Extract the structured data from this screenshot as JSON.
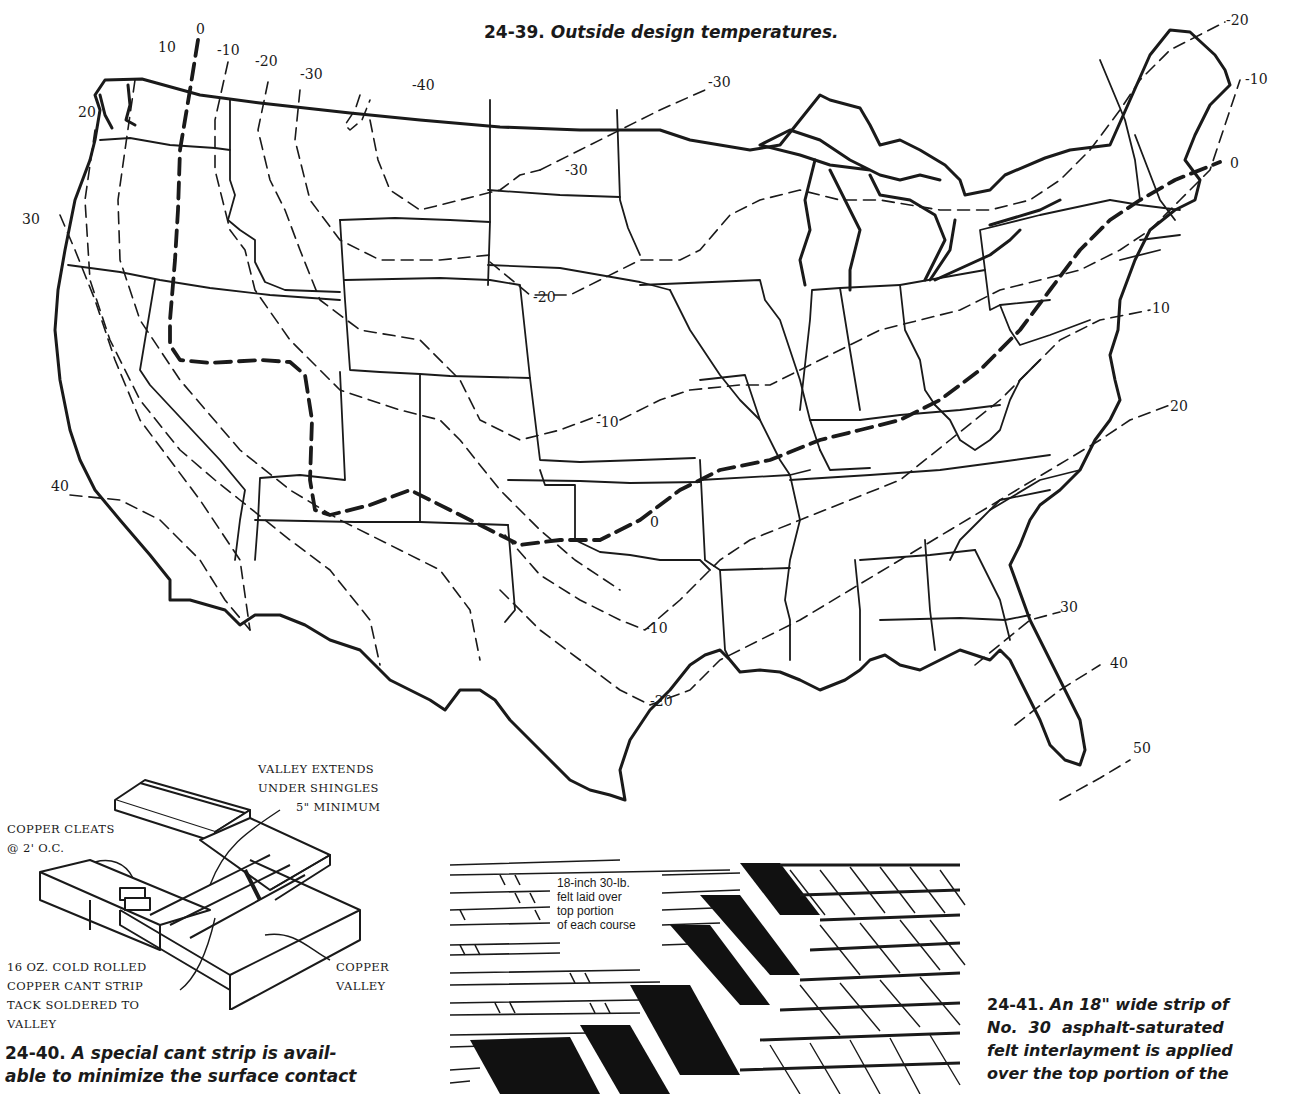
{
  "figure_24_39": {
    "number": "24-39.",
    "title": "Outside design temperatures.",
    "map_region": "Contiguous United States",
    "isotherm_labels": [
      {
        "value": "0",
        "x": 196,
        "y": 34
      },
      {
        "value": "10",
        "x": 158,
        "y": 52
      },
      {
        "value": "-10",
        "x": 217,
        "y": 55
      },
      {
        "value": "-20",
        "x": 255,
        "y": 66
      },
      {
        "value": "-30",
        "x": 300,
        "y": 79
      },
      {
        "value": "-40",
        "x": 412,
        "y": 90
      },
      {
        "value": "20",
        "x": 78,
        "y": 117
      },
      {
        "value": "-30",
        "x": 708,
        "y": 87
      },
      {
        "value": "-30",
        "x": 565,
        "y": 175
      },
      {
        "value": "30",
        "x": 22,
        "y": 224
      },
      {
        "value": "-20",
        "x": 533,
        "y": 302
      },
      {
        "value": "-10",
        "x": 596,
        "y": 427
      },
      {
        "value": "40",
        "x": 51,
        "y": 491
      },
      {
        "value": "0",
        "x": 650,
        "y": 527
      },
      {
        "value": "-10",
        "x": 645,
        "y": 633
      },
      {
        "value": "-20",
        "x": 650,
        "y": 706
      },
      {
        "value": "-20",
        "x": 1226,
        "y": 25
      },
      {
        "value": "-10",
        "x": 1245,
        "y": 84
      },
      {
        "value": "0",
        "x": 1230,
        "y": 168
      },
      {
        "value": "10",
        "x": 1152,
        "y": 313
      },
      {
        "value": "20",
        "x": 1170,
        "y": 411
      },
      {
        "value": "30",
        "x": 1060,
        "y": 612
      },
      {
        "value": "40",
        "x": 1110,
        "y": 668
      },
      {
        "value": "50",
        "x": 1133,
        "y": 753
      }
    ]
  },
  "figure_24_40": {
    "callouts": {
      "valley_extends": [
        "VALLEY EXTENDS",
        "UNDER SHINGLES",
        "5\" MINIMUM"
      ],
      "copper_cleats": [
        "COPPER CLEATS",
        "@ 2' O.C."
      ],
      "cant_strip": [
        "16 OZ. COLD ROLLED",
        "COPPER CANT STRIP",
        "TACK SOLDERED TO",
        "VALLEY"
      ],
      "copper_valley": [
        "COPPER",
        "VALLEY"
      ]
    },
    "number": "24-40.",
    "caption_line1": "A special cant strip is avail-",
    "caption_line2": "able to minimize the surface contact"
  },
  "figure_24_41": {
    "felt_label": [
      "18-inch 30-lb.",
      "felt laid over",
      "top portion",
      "of each course"
    ],
    "number": "24-41.",
    "caption_line1": "An 18\" wide strip of",
    "caption_line2": "No.  30  asphalt-saturated",
    "caption_line3": "felt interlayment is applied",
    "caption_line4": "over the top portion of the"
  },
  "colors": {
    "ink": "#1a1a1a",
    "paper": "#ffffff"
  }
}
